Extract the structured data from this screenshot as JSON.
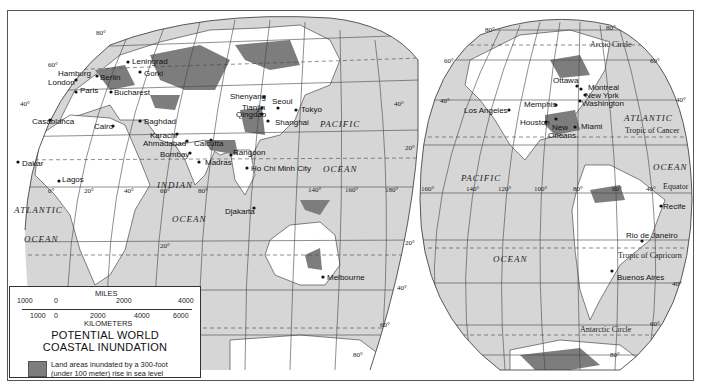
{
  "map": {
    "title_line1": "POTENTIAL WORLD",
    "title_line2": "COASTAL INUNDATION",
    "legend": {
      "swatch_color": "#7d7d7d",
      "text_line1": "Land areas inundated by a 300-foot",
      "text_line2": "(under 100 meter) rise in sea level"
    },
    "scale": {
      "miles_label": "MILES",
      "miles_ticks": [
        "1000",
        "0",
        "2000",
        "4000"
      ],
      "km_label": "KILOMETERS",
      "km_ticks": [
        "1000",
        "0",
        "2000",
        "4000",
        "6000"
      ]
    },
    "colors": {
      "ocean": "#d6d6d6",
      "land": "#ffffff",
      "inundated": "#7d7d7d",
      "grid": "#444444"
    },
    "oceans": {
      "atlantic_w1": "ATLANTIC",
      "atlantic_w2": "OCEAN",
      "indian_1": "INDIAN",
      "indian_2": "OCEAN",
      "pacific_w1": "PACIFIC",
      "pacific_w2": "OCEAN",
      "pacific_e1": "PACIFIC",
      "pacific_e2": "OCEAN",
      "atlantic_e1": "ATLANTIC",
      "atlantic_e2": "OCEAN"
    },
    "lines": {
      "arctic": "Arctic Circle",
      "cancer": "Tropic of Cancer",
      "equator": "Equator",
      "capricorn": "Tropic of Capricorn",
      "antarctic": "Antarctic Circle"
    },
    "cities": {
      "hamburg": "Hamburg",
      "london": "London",
      "berlin": "Berlin",
      "paris": "Paris",
      "leningrad": "Leningrad",
      "gorki": "Gorki",
      "bucharest": "Bucharest",
      "casablanca": "Casablanca",
      "cairo": "Cairo",
      "baghdad": "Baghdad",
      "karachi": "Karachi",
      "ahmadabad": "Ahmadabad",
      "bombay": "Bombay",
      "calcutta": "Calcutta",
      "madras": "Madras",
      "rangoon": "Rangoon",
      "hochiminh": "Ho Chi Minh City",
      "djakarta": "Djakarta",
      "dakar": "Dakar",
      "lagos": "Lagos",
      "shenyang": "Shenyang",
      "tianjin": "Tianjin",
      "qingdao": "Qingdao",
      "seoul": "Seoul",
      "tokyo": "Tokyo",
      "shanghai": "Shanghai",
      "melbourne": "Melbourne",
      "ottawa": "Ottawa",
      "montreal": "Montreal",
      "newyork": "New York",
      "washington": "Washington",
      "memphis": "Memphis",
      "losangeles": "Los Angeles",
      "houston": "Houston",
      "neworleans1": "New",
      "neworleans2": "Orleans",
      "miami": "Miami",
      "recife": "Recife",
      "rio": "Rio de Janeiro",
      "buenosaires": "Buenos Aires"
    },
    "degrees": {
      "n80": "80°",
      "n60": "60°",
      "n40": "40°",
      "n20": "20°",
      "s20": "20°",
      "s40": "40°",
      "s60": "60°",
      "s80": "80°",
      "e0": "0°",
      "e20": "20°",
      "e40": "40°",
      "e60": "60°",
      "e80": "80°",
      "e140": "140°",
      "e160": "160°",
      "e180": "180°",
      "w160": "160°",
      "w140": "140°",
      "w120": "120°",
      "w100": "100°",
      "w80": "80°",
      "w60": "60°",
      "w40": "40°"
    }
  }
}
